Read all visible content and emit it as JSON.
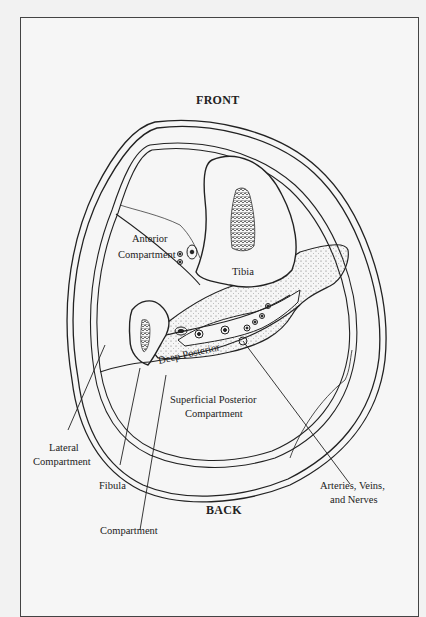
{
  "diagram": {
    "type": "anatomical cross-section",
    "orientation": {
      "top": "FRONT",
      "bottom": "BACK"
    },
    "labels": {
      "front": "FRONT",
      "back": "BACK",
      "anterior_line1": "Anterior",
      "anterior_line2": "Compartment",
      "tibia": "Tibia",
      "deep_posterior": "Deep Posterior",
      "superficial_line1": "Superficial Posterior",
      "superficial_line2": "Compartment",
      "lateral_line1": "Lateral",
      "lateral_line2": "Compartment",
      "fibula": "Fibula",
      "deep_compartment": "Compartment",
      "vessels_line1": "Arteries, Veins,",
      "vessels_line2": "and Nerves"
    },
    "colors": {
      "line": "#222222",
      "background": "#f6f6f6",
      "page": "#f2f2f2"
    }
  }
}
